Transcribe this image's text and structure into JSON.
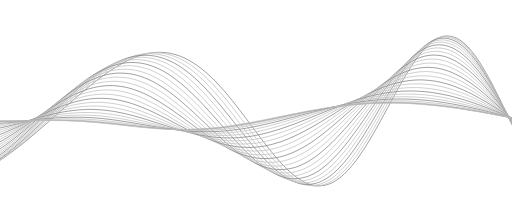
{
  "illustration": {
    "subject": "abstract flowing wave line art",
    "background": "#ffffff",
    "stroke_color": "#8a8a8a",
    "stroke_color_light": "#c4c4c4",
    "line_count": 26,
    "width": 512,
    "height": 215,
    "curve_a": [
      [
        0,
        70
      ],
      [
        60,
        95
      ],
      [
        143,
        183
      ],
      [
        235,
        60
      ],
      [
        318,
        183
      ],
      [
        385,
        72
      ],
      [
        505,
        122
      ]
    ],
    "curve_b": [
      [
        0,
        100
      ],
      [
        60,
        95
      ],
      [
        143,
        183
      ],
      [
        235,
        170
      ],
      [
        318,
        183
      ],
      [
        390,
        100
      ],
      [
        505,
        128
      ]
    ],
    "curve_c": [
      [
        0,
        130
      ],
      [
        60,
        95
      ],
      [
        90,
        40
      ],
      [
        160,
        30
      ],
      [
        235,
        60
      ],
      [
        300,
        95
      ],
      [
        318,
        183
      ],
      [
        350,
        70
      ],
      [
        420,
        150
      ],
      [
        505,
        115
      ]
    ]
  }
}
